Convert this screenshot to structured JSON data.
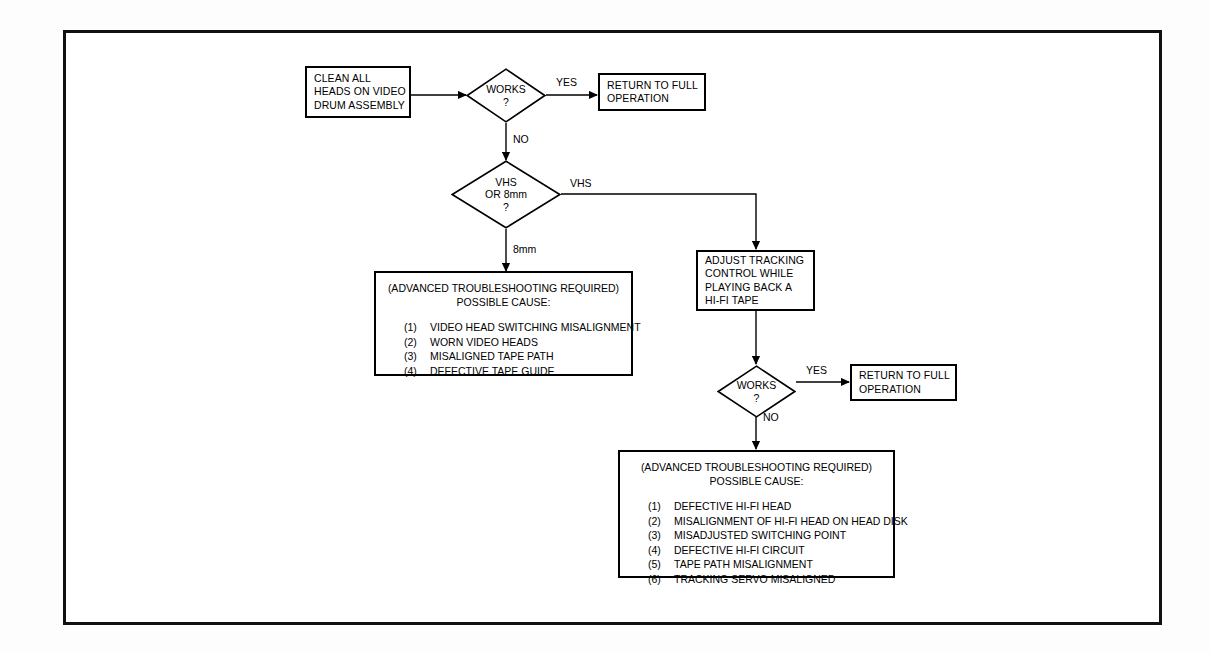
{
  "document": {
    "type": "flowchart",
    "title": "VCR Video Head / Hi-Fi Troubleshooting Flowchart",
    "frame_color": "#111111",
    "line_color": "#000000",
    "background": "#ffffff"
  },
  "nodes": {
    "clean_heads": {
      "shape": "process",
      "lines": [
        "CLEAN ALL",
        "HEADS ON VIDEO",
        "DRUM ASSEMBLY"
      ]
    },
    "works_1": {
      "shape": "decision",
      "lines": [
        "WORKS",
        "?"
      ]
    },
    "return_1": {
      "shape": "process",
      "lines": [
        "RETURN TO FULL",
        "OPERATION"
      ]
    },
    "format_check": {
      "shape": "decision",
      "lines": [
        "VHS",
        "OR 8mm",
        "?"
      ]
    },
    "adjust_tracking": {
      "shape": "process",
      "lines": [
        "ADJUST TRACKING",
        "CONTROL WHILE",
        "PLAYING BACK A",
        "HI-FI TAPE"
      ]
    },
    "works_2": {
      "shape": "decision",
      "lines": [
        "WORKS",
        "?"
      ]
    },
    "return_2": {
      "shape": "process",
      "lines": [
        "RETURN TO FULL",
        "OPERATION"
      ]
    },
    "causes_8mm": {
      "shape": "note",
      "header_line_1": "(ADVANCED TROUBLESHOOTING REQUIRED)",
      "header_line_2": "POSSIBLE CAUSE:",
      "items": [
        {
          "num": "(1)",
          "text": "VIDEO HEAD SWITCHING MISALIGNMENT"
        },
        {
          "num": "(2)",
          "text": "WORN VIDEO HEADS"
        },
        {
          "num": "(3)",
          "text": "MISALIGNED TAPE PATH"
        },
        {
          "num": "(4)",
          "text": "DEFECTIVE TAPE GUIDE"
        }
      ]
    },
    "causes_hifi": {
      "shape": "note",
      "header_line_1": "(ADVANCED TROUBLESHOOTING REQUIRED)",
      "header_line_2": "POSSIBLE CAUSE:",
      "items": [
        {
          "num": "(1)",
          "text": "DEFECTIVE HI-FI HEAD"
        },
        {
          "num": "(2)",
          "text": "MISALIGNMENT OF HI-FI HEAD ON HEAD DISK"
        },
        {
          "num": "(3)",
          "text": "MISADJUSTED SWITCHING POINT"
        },
        {
          "num": "(4)",
          "text": "DEFECTIVE HI-FI CIRCUIT"
        },
        {
          "num": "(5)",
          "text": "TAPE PATH MISALIGNMENT"
        },
        {
          "num": "(6)",
          "text": "TRACKING SERVO MISALIGNED"
        }
      ]
    }
  },
  "edge_labels": {
    "works1_yes": "YES",
    "works1_no": "NO",
    "format_vhs": "VHS",
    "format_8mm": "8mm",
    "works2_yes": "YES",
    "works2_no": "NO"
  }
}
